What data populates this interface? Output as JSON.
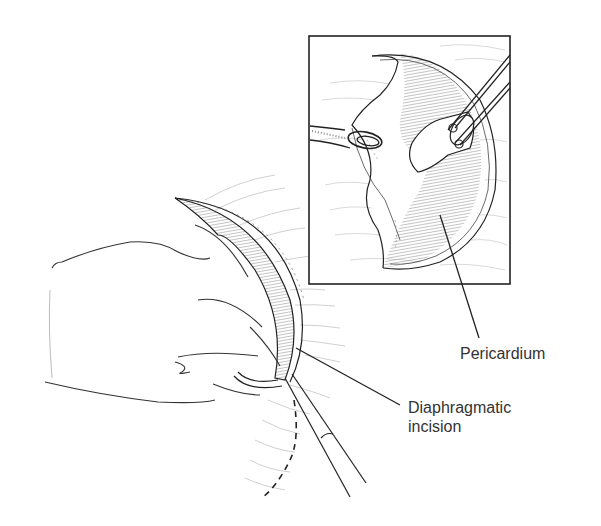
{
  "figure": {
    "type": "surgical-illustration",
    "labels": {
      "pericardium": "Pericardium",
      "diaphragmatic_incision_line1": "Diaphragmatic",
      "diaphragmatic_incision_line2": "incision"
    },
    "colors": {
      "line": "#222222",
      "hatch": "#9a9a9a",
      "faint": "#bbbbbb",
      "text": "#333333"
    }
  }
}
